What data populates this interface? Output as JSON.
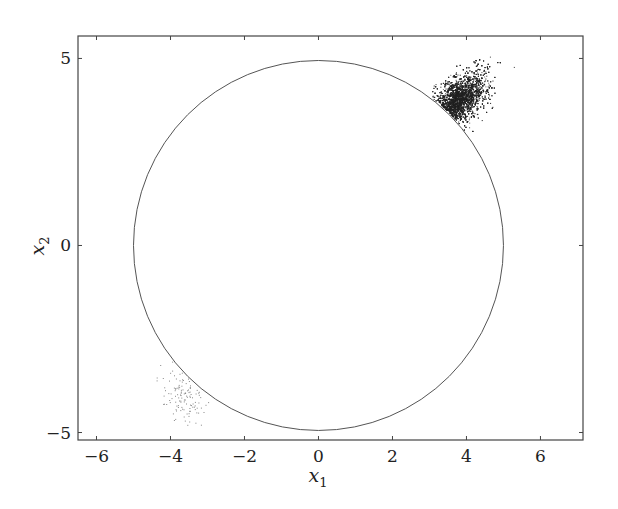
{
  "chart_data": {
    "type": "scatter",
    "title": "",
    "xlabel": "x_1",
    "ylabel": "x_2",
    "xlim": [
      -6.5,
      7.15
    ],
    "ylim": [
      -5.2,
      5.6
    ],
    "grid": false,
    "legend": null,
    "x_ticks": [
      -6,
      -4,
      -2,
      0,
      2,
      4,
      6
    ],
    "y_ticks": [
      -5,
      0,
      5
    ],
    "x_tick_labels": [
      "−6",
      "−4",
      "−2",
      "0",
      "2",
      "4",
      "6"
    ],
    "y_tick_labels": [
      "−5",
      "0",
      "5"
    ],
    "shapes": [
      {
        "type": "circle",
        "center": [
          0,
          0
        ],
        "radius": 5,
        "color": "#555555"
      }
    ],
    "series": [
      {
        "name": "dense cluster (upper right)",
        "description": "Dense point cloud just outside the circle near (3.8, 3.6), spreading out to about (5.7, 5.5)",
        "center": [
          3.8,
          3.7
        ],
        "x_range": [
          2.9,
          5.7
        ],
        "y_range": [
          2.5,
          5.5
        ],
        "density": "high",
        "approx_count": 4000,
        "color": "#333333"
      },
      {
        "name": "sparse cluster (lower left)",
        "description": "Sparse point cloud just outside the circle near (-3.7, -4.0)",
        "center": [
          -3.7,
          -4.0
        ],
        "x_range": [
          -4.4,
          -3.0
        ],
        "y_range": [
          -4.9,
          -3.0
        ],
        "density": "low",
        "approx_count": 120,
        "color": "#666666"
      }
    ]
  },
  "axes": {
    "xlabel_main": "x",
    "xlabel_sub": "1",
    "ylabel_main": "x",
    "ylabel_sub": "2"
  }
}
